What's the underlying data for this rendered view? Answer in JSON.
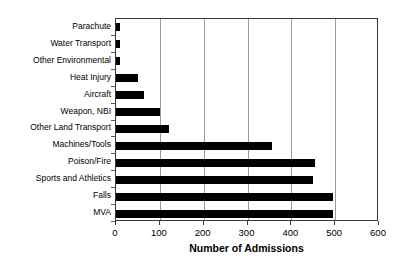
{
  "chart_data": {
    "type": "bar",
    "orientation": "horizontal",
    "title": "",
    "xlabel": "Number of Admissions",
    "ylabel": "",
    "xlim": [
      0,
      600
    ],
    "xticks": [
      0,
      100,
      200,
      300,
      400,
      500,
      600
    ],
    "grid": true,
    "grid_axis": "x",
    "legend": false,
    "bar_color": "#000000",
    "categories": [
      "Parachute",
      "Water Transport",
      "Other Environmental",
      "Heat Injury",
      "Aircraft",
      "Weapon, NBI",
      "Other Land Transport",
      "Machines/Tools",
      "Poison/Fire",
      "Sports and Athletics",
      "Falls",
      "MVA"
    ],
    "values": [
      8,
      8,
      10,
      50,
      63,
      100,
      120,
      355,
      455,
      450,
      495,
      495
    ]
  }
}
